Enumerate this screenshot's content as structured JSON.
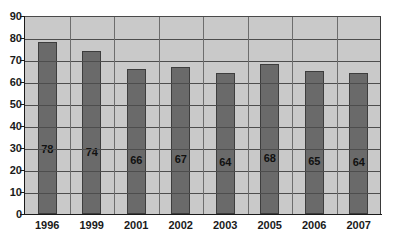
{
  "chart_data": {
    "type": "bar",
    "title": "",
    "subtitle": "",
    "xlabel": "",
    "ylabel": "",
    "categories": [
      "1996",
      "1999",
      "2001",
      "2002",
      "2003",
      "2005",
      "2006",
      "2007"
    ],
    "values": [
      78,
      74,
      66,
      67,
      64,
      68,
      65,
      64
    ],
    "data_labels": [
      "78",
      "74",
      "66",
      "67",
      "64",
      "68",
      "65",
      "64"
    ],
    "ylim": [
      0,
      90
    ],
    "ytick_step": 10,
    "ytick_labels": [
      "0",
      "10",
      "20",
      "30",
      "40",
      "50",
      "60",
      "70",
      "80",
      "90"
    ],
    "grid": {
      "horizontal": true,
      "vertical": true
    },
    "legend": {
      "visible": false,
      "position": "none",
      "entries": []
    },
    "annotations": [],
    "colors": {
      "bar_fill": "#6a6a6a",
      "bar_border": "#3d3d3d",
      "plot_background": "#c9c9c9",
      "gridline": "#4d6d4d",
      "axis": "#1a1a1a",
      "label_text": "#111111",
      "page_background": "#ffffff"
    }
  }
}
